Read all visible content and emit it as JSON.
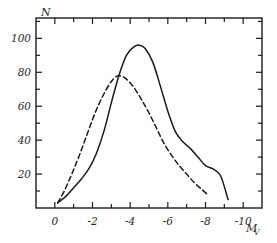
{
  "chart_data": {
    "type": "line",
    "title": "",
    "xlabel": "Mv",
    "ylabel": "N",
    "xlim": [
      1,
      -11
    ],
    "ylim": [
      0,
      112
    ],
    "grid": false,
    "legend": "none",
    "x_ticks_major": [
      "0",
      "-2",
      "-4",
      "-6",
      "-8",
      "-10"
    ],
    "x_tick_values_major": [
      0,
      -2,
      -4,
      -6,
      -8,
      -10
    ],
    "x_tick_values_minor": [
      -1,
      -3,
      -5,
      -7,
      -9
    ],
    "y_ticks_major": [
      "20",
      "40",
      "60",
      "80",
      "100"
    ],
    "y_tick_values_major": [
      20,
      40,
      60,
      80,
      100
    ],
    "y_tick_values_minor": [
      10,
      30,
      50,
      70,
      90,
      110
    ],
    "series": [
      {
        "name": "solid-curve",
        "style": "solid",
        "color": "#1a1a1a",
        "peak_x": -4.5,
        "peak_y": 96,
        "x": [
          -0.15,
          -0.6,
          -1.0,
          -1.4,
          -1.8,
          -2.2,
          -2.6,
          -3.0,
          -3.4,
          -3.8,
          -4.2,
          -4.5,
          -4.8,
          -5.2,
          -5.6,
          -6.0,
          -6.4,
          -6.8,
          -7.2,
          -7.6,
          -8.0,
          -8.4,
          -8.8,
          -9.2
        ],
        "y": [
          3,
          7,
          12,
          17,
          23,
          32,
          45,
          62,
          78,
          90,
          95,
          96,
          94,
          86,
          72,
          57,
          45,
          39,
          35,
          30,
          25,
          23,
          19,
          5
        ]
      },
      {
        "name": "dashed-curve",
        "style": "dashed",
        "color": "#1a1a1a",
        "peak_x": -3.45,
        "peak_y": 78,
        "x": [
          -0.15,
          -0.5,
          -0.9,
          -1.3,
          -1.7,
          -2.1,
          -2.5,
          -2.9,
          -3.2,
          -3.45,
          -3.8,
          -4.2,
          -4.6,
          -5.0,
          -5.4,
          -5.8,
          -6.2,
          -6.6,
          -7.0,
          -7.4,
          -7.8,
          -8.1
        ],
        "y": [
          3,
          10,
          20,
          31,
          43,
          55,
          65,
          73,
          77,
          78,
          76,
          71,
          64,
          56,
          47,
          38,
          31,
          25,
          20,
          15,
          11,
          8
        ]
      }
    ]
  },
  "axes": {
    "y_axis_label": "N",
    "x_axis_label_magnitude": "M",
    "x_axis_label_sub": "V"
  }
}
